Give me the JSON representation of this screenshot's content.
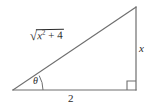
{
  "figure": {
    "name": "right-triangle-diagram",
    "background_color": "#ffffff",
    "stroke_color": "#6e6e6e",
    "text_color": "#2b2b2b",
    "vertices": {
      "left": [
        13,
        90
      ],
      "bottom_right": [
        136,
        90
      ],
      "top_right": [
        136,
        7
      ]
    }
  },
  "labels": {
    "hypotenuse": {
      "radical_sign": "√",
      "radicand_base": "x",
      "radicand_exponent": "2",
      "radicand_rest": "+ 4",
      "full_text": "√(x² + 4)"
    },
    "vertical_leg": "x",
    "base": "2",
    "angle": "θ"
  },
  "markers": {
    "right_angle": "right-angle-square",
    "angle_arc": "theta-arc"
  }
}
